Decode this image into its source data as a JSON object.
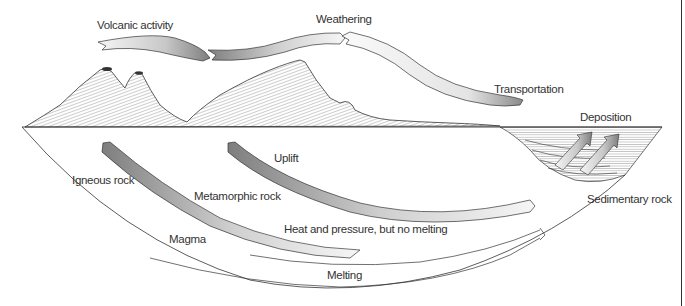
{
  "diagram": {
    "labels": {
      "volcanic_activity": "Volcanic activity",
      "weathering": "Weathering",
      "transportation": "Transportation",
      "deposition": "Deposition",
      "uplift": "Uplift",
      "igneous_rock": "Igneous rock",
      "metamorphic_rock": "Metamorphic rock",
      "sedimentary_rock": "Sedimentary rock",
      "heat_pressure": "Heat and pressure, but no melting",
      "magma": "Magma",
      "melting": "Melting"
    },
    "colors": {
      "ink": "#333333",
      "arrow_dark": "#8a8a8a",
      "arrow_light": "#f4f4f4",
      "background": "#ffffff"
    }
  }
}
